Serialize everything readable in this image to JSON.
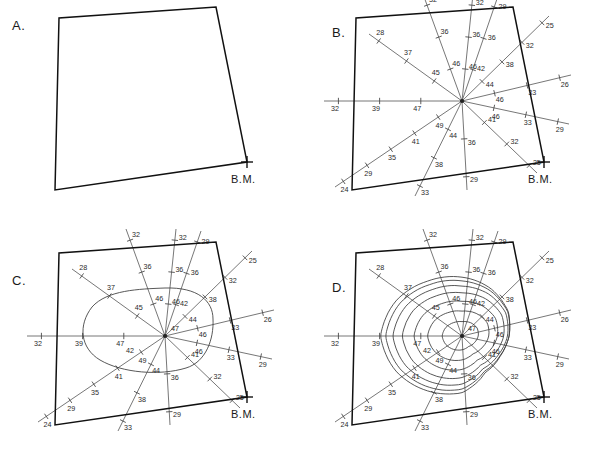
{
  "figure": {
    "benchmark_label": "B.M.",
    "panels": [
      {
        "id": "a",
        "label": "A.",
        "caption": "Boundary outline with benchmark",
        "has_rays": false,
        "has_contours": false
      },
      {
        "id": "b",
        "label": "B.",
        "caption": "Radial survey lines with spot elevations",
        "has_rays": true,
        "has_contours": false
      },
      {
        "id": "c",
        "label": "C.",
        "caption": "First contour interpolated",
        "has_rays": true,
        "has_contours": true
      },
      {
        "id": "d",
        "label": "D.",
        "caption": "Completed contour map",
        "has_rays": true,
        "has_contours": true
      }
    ]
  },
  "colors": {
    "boundary": "#111111",
    "ray": "#4a4a4a",
    "contour": "#3a3a3a",
    "text": "#1a1a1a",
    "background": "#ffffff"
  },
  "survey": {
    "hub": {
      "x": 165,
      "y": 101
    },
    "boundary_points": "55,190 59,18 216,7 247,162",
    "benchmark": {
      "x": 247,
      "y": 162
    },
    "rays": [
      {
        "name": "ray-n",
        "bearing": "N",
        "end_x": 176,
        "end_y": -6,
        "elevations": [
          46,
          36,
          32
        ]
      },
      {
        "name": "ray-nne",
        "bearing": "NNE",
        "end_x": 201,
        "end_y": -4,
        "elevations": [
          42,
          36,
          29
        ]
      },
      {
        "name": "ray-ne",
        "bearing": "NE",
        "end_x": 252,
        "end_y": 16,
        "elevations": [
          44,
          38,
          32,
          25
        ]
      },
      {
        "name": "ray-ene",
        "bearing": "ENE",
        "end_x": 274,
        "end_y": 75,
        "elevations": [
          46,
          33,
          26
        ]
      },
      {
        "name": "ray-e",
        "bearing": "E",
        "end_x": 272,
        "end_y": 124,
        "elevations": [
          46,
          33,
          29
        ]
      },
      {
        "name": "ray-ese",
        "bearing": "ESE",
        "end_x": 240,
        "end_y": 173,
        "elevations": [
          41,
          32,
          25
        ]
      },
      {
        "name": "ray-s",
        "bearing": "S",
        "end_x": 170,
        "end_y": 190,
        "elevations": [
          36,
          29
        ]
      },
      {
        "name": "ray-ssw",
        "bearing": "SSW",
        "end_x": 118,
        "end_y": 196,
        "elevations": [
          44,
          38,
          33
        ]
      },
      {
        "name": "ray-sw",
        "bearing": "SW",
        "end_x": 38,
        "end_y": 187,
        "elevations": [
          49,
          41,
          35,
          29,
          24
        ]
      },
      {
        "name": "ray-w",
        "bearing": "W",
        "end_x": 27,
        "end_y": 101,
        "elevations": [
          47,
          39,
          32
        ]
      },
      {
        "name": "ray-nw",
        "bearing": "NW",
        "end_x": 72,
        "end_y": 34,
        "elevations": [
          45,
          37,
          28
        ]
      },
      {
        "name": "ray-nnw",
        "bearing": "NNW",
        "end_x": 126,
        "end_y": -6,
        "elevations": [
          46,
          36,
          32
        ]
      }
    ],
    "extra_labels_c": [
      47,
      42
    ],
    "contour_interval": 5,
    "contour_values": [
      45,
      40,
      35,
      30,
      25,
      20
    ],
    "summit_elevation": 49,
    "low_elevation": 24
  },
  "chart_data": {
    "type": "scatter",
    "xlabel": "",
    "ylabel": "",
    "series": [
      {
        "name": "N",
        "values": [
          46,
          36,
          32
        ]
      },
      {
        "name": "NNE",
        "values": [
          42,
          36,
          29
        ]
      },
      {
        "name": "NE",
        "values": [
          44,
          38,
          32,
          25
        ]
      },
      {
        "name": "ENE",
        "values": [
          46,
          33,
          26
        ]
      },
      {
        "name": "E",
        "values": [
          46,
          33,
          29
        ]
      },
      {
        "name": "ESE",
        "values": [
          41,
          32,
          25
        ]
      },
      {
        "name": "S",
        "values": [
          36,
          29
        ]
      },
      {
        "name": "SSW",
        "values": [
          44,
          38,
          33
        ]
      },
      {
        "name": "SW",
        "values": [
          49,
          41,
          35,
          29,
          24
        ]
      },
      {
        "name": "W",
        "values": [
          47,
          39,
          32
        ]
      },
      {
        "name": "NW",
        "values": [
          45,
          37,
          28
        ]
      },
      {
        "name": "NNW",
        "values": [
          46,
          36,
          32
        ]
      }
    ],
    "annotations": [
      "B.M."
    ],
    "grid": false,
    "legend": "none"
  }
}
